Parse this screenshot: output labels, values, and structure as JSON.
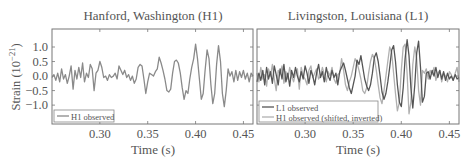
{
  "figure": {
    "ylabel": "Strain (10",
    "ylabel_exp": "−21",
    "ylabel_close": ")",
    "xlabel": "Time (s)"
  },
  "colors": {
    "h1_observed": "#8a8a8a",
    "l1_observed": "#555555",
    "h1_shifted": "#b0b0b0",
    "axis": "#777777",
    "text": "#555555"
  },
  "chart_data": [
    {
      "type": "line",
      "title": "Hanford, Washington (H1)",
      "xlabel": "Time (s)",
      "ylabel": "Strain (10^-21)",
      "xlim": [
        0.25,
        0.46
      ],
      "ylim": [
        -1.65,
        1.62
      ],
      "xticks": [
        0.3,
        0.35,
        0.4,
        0.45
      ],
      "xtick_labels": [
        "0.30",
        "0.35",
        "0.40",
        "0.45"
      ],
      "yticks": [
        1.0,
        0.5,
        0.0,
        -0.5,
        -1.0
      ],
      "ytick_labels": [
        "1.0",
        "0.5",
        "0.0",
        "−0.5",
        "−1.0"
      ],
      "grid": false,
      "legend_position": "lower left",
      "series": [
        {
          "name": "H1 observed",
          "color": "#8a8a8a",
          "t": [
            0.25,
            0.252,
            0.254,
            0.256,
            0.258,
            0.26,
            0.262,
            0.264,
            0.266,
            0.268,
            0.27,
            0.272,
            0.274,
            0.276,
            0.278,
            0.28,
            0.282,
            0.284,
            0.286,
            0.288,
            0.29,
            0.292,
            0.294,
            0.296,
            0.298,
            0.3,
            0.302,
            0.304,
            0.306,
            0.308,
            0.31,
            0.312,
            0.314,
            0.316,
            0.318,
            0.32,
            0.322,
            0.324,
            0.326,
            0.328,
            0.33,
            0.332,
            0.334,
            0.336,
            0.338,
            0.34,
            0.342,
            0.344,
            0.346,
            0.348,
            0.35,
            0.352,
            0.354,
            0.356,
            0.358,
            0.36,
            0.362,
            0.364,
            0.366,
            0.368,
            0.37,
            0.372,
            0.374,
            0.376,
            0.378,
            0.38,
            0.382,
            0.384,
            0.386,
            0.388,
            0.39,
            0.392,
            0.394,
            0.396,
            0.398,
            0.4,
            0.402,
            0.404,
            0.406,
            0.408,
            0.41,
            0.412,
            0.414,
            0.416,
            0.418,
            0.42,
            0.422,
            0.424,
            0.426,
            0.428,
            0.43,
            0.432,
            0.434,
            0.436,
            0.438,
            0.44,
            0.442,
            0.444,
            0.446,
            0.448,
            0.45,
            0.452,
            0.454,
            0.456,
            0.458,
            0.46
          ],
          "v": [
            -0.05,
            0.05,
            -0.15,
            0.1,
            -0.2,
            0.25,
            -0.1,
            0.05,
            -0.25,
            0.0,
            0.35,
            -0.45,
            0.2,
            -0.1,
            0.3,
            -0.05,
            0.45,
            -0.2,
            0.1,
            -0.05,
            0.4,
            0.25,
            -0.5,
            0.1,
            0.2,
            0.5,
            0.3,
            -0.05,
            0.0,
            -0.15,
            0.05,
            -0.05,
            0.0,
            0.1,
            -0.1,
            0.35,
            0.2,
            0.05,
            0.2,
            -0.05,
            0.05,
            -0.15,
            0.0,
            -0.25,
            -0.1,
            0.3,
            0.4,
            0.35,
            -0.1,
            -0.6,
            -0.2,
            0.1,
            0.05,
            0.0,
            0.15,
            0.25,
            0.65,
            0.45,
            0.2,
            -0.1,
            -0.5,
            -0.55,
            -0.45,
            0.1,
            0.5,
            0.55,
            0.45,
            0.1,
            -0.4,
            -0.8,
            -0.5,
            -0.6,
            -0.1,
            0.3,
            0.6,
            1.1,
            0.6,
            -0.1,
            -0.8,
            -0.6,
            0.2,
            0.9,
            0.6,
            -0.3,
            -0.95,
            -0.6,
            0.4,
            1.05,
            0.5,
            -0.6,
            -1.05,
            -0.5,
            0.25,
            0.0,
            0.15,
            -0.2,
            0.2,
            -0.15,
            0.15,
            -0.05,
            0.2,
            -0.1,
            0.1,
            -0.2,
            0.1,
            0.0
          ],
          "legend_label": "H1 observed"
        }
      ]
    },
    {
      "type": "line",
      "title": "Livingston, Louisiana (L1)",
      "xlabel": "Time (s)",
      "xlim": [
        0.25,
        0.46
      ],
      "ylim": [
        -1.65,
        1.62
      ],
      "xticks": [
        0.3,
        0.35,
        0.4,
        0.45
      ],
      "xtick_labels": [
        "0.30",
        "0.35",
        "0.40",
        "0.45"
      ],
      "yticks": [
        1.0,
        0.5,
        0.0,
        -0.5,
        -1.0
      ],
      "grid": false,
      "legend_position": "lower left",
      "series": [
        {
          "name": "L1 observed",
          "color": "#555555",
          "legend_label": "L1 observed",
          "t": [
            0.25,
            0.252,
            0.254,
            0.256,
            0.258,
            0.26,
            0.262,
            0.264,
            0.266,
            0.268,
            0.27,
            0.272,
            0.274,
            0.276,
            0.278,
            0.28,
            0.282,
            0.284,
            0.286,
            0.288,
            0.29,
            0.292,
            0.294,
            0.296,
            0.298,
            0.3,
            0.302,
            0.304,
            0.306,
            0.308,
            0.31,
            0.312,
            0.314,
            0.316,
            0.318,
            0.32,
            0.322,
            0.324,
            0.326,
            0.328,
            0.33,
            0.332,
            0.334,
            0.336,
            0.338,
            0.34,
            0.342,
            0.344,
            0.346,
            0.348,
            0.35,
            0.352,
            0.354,
            0.356,
            0.358,
            0.36,
            0.362,
            0.364,
            0.366,
            0.368,
            0.37,
            0.372,
            0.374,
            0.376,
            0.378,
            0.38,
            0.382,
            0.384,
            0.386,
            0.388,
            0.39,
            0.392,
            0.394,
            0.396,
            0.398,
            0.4,
            0.402,
            0.404,
            0.406,
            0.408,
            0.41,
            0.412,
            0.414,
            0.416,
            0.418,
            0.42,
            0.422,
            0.424,
            0.426,
            0.428,
            0.43,
            0.432,
            0.434,
            0.436,
            0.438,
            0.44,
            0.442,
            0.444,
            0.446,
            0.448,
            0.45,
            0.452,
            0.454,
            0.456,
            0.458,
            0.46
          ],
          "v": [
            -0.2,
            0.1,
            -0.15,
            0.2,
            -0.3,
            0.3,
            -0.1,
            0.15,
            -0.25,
            0.35,
            0.05,
            -0.3,
            0.25,
            -0.1,
            0.4,
            -0.2,
            0.1,
            -0.35,
            0.2,
            -0.05,
            0.3,
            0.0,
            -0.2,
            0.15,
            -0.1,
            0.35,
            0.1,
            -0.25,
            0.2,
            0.0,
            -0.3,
            0.1,
            0.4,
            -0.05,
            0.15,
            -0.2,
            0.3,
            0.0,
            -0.15,
            0.2,
            -0.05,
            0.1,
            -0.3,
            0.15,
            0.3,
            0.45,
            0.2,
            -0.1,
            -0.4,
            -0.6,
            -0.3,
            0.0,
            0.55,
            0.4,
            0.7,
            0.3,
            -0.1,
            -0.35,
            -0.5,
            -0.3,
            0.1,
            0.65,
            0.8,
            0.5,
            0.0,
            -0.55,
            -0.8,
            -0.6,
            -0.2,
            0.3,
            0.9,
            1.05,
            0.5,
            -0.3,
            -0.9,
            -1.05,
            -0.4,
            0.6,
            1.25,
            0.7,
            -0.4,
            -1.1,
            -0.3,
            0.8,
            1.2,
            0.3,
            -0.9,
            -0.7,
            0.1,
            0.15,
            -0.1,
            0.2,
            0.0,
            0.3,
            -0.05,
            0.2,
            -0.1,
            0.15,
            -0.15,
            0.1,
            -0.1,
            0.0,
            -0.15,
            0.05,
            -0.1,
            -0.05
          ],
          "note": "approximate trace"
        },
        {
          "name": "H1 observed (shifted, inverted)",
          "color": "#b0b0b0",
          "legend_label": "H1 observed (shifted, inverted)",
          "t": [
            0.25,
            0.252,
            0.254,
            0.256,
            0.258,
            0.26,
            0.262,
            0.264,
            0.266,
            0.268,
            0.27,
            0.272,
            0.274,
            0.276,
            0.278,
            0.28,
            0.282,
            0.284,
            0.286,
            0.288,
            0.29,
            0.292,
            0.294,
            0.296,
            0.298,
            0.3,
            0.302,
            0.304,
            0.306,
            0.308,
            0.31,
            0.312,
            0.314,
            0.316,
            0.318,
            0.32,
            0.322,
            0.324,
            0.326,
            0.328,
            0.33,
            0.332,
            0.334,
            0.336,
            0.338,
            0.34,
            0.342,
            0.344,
            0.346,
            0.348,
            0.35,
            0.352,
            0.354,
            0.356,
            0.358,
            0.36,
            0.362,
            0.364,
            0.366,
            0.368,
            0.37,
            0.372,
            0.374,
            0.376,
            0.378,
            0.38,
            0.382,
            0.384,
            0.386,
            0.388,
            0.39,
            0.392,
            0.394,
            0.396,
            0.398,
            0.4,
            0.402,
            0.404,
            0.406,
            0.408,
            0.41,
            0.412,
            0.414,
            0.416,
            0.418,
            0.42,
            0.422,
            0.424,
            0.426,
            0.428,
            0.43,
            0.432,
            0.434,
            0.436,
            0.438,
            0.44,
            0.442,
            0.444,
            0.446,
            0.448,
            0.45,
            0.452,
            0.454,
            0.456,
            0.458,
            0.46
          ],
          "v": [
            0.1,
            -0.2,
            0.3,
            -0.1,
            0.05,
            -0.35,
            0.25,
            0.0,
            0.4,
            -0.1,
            -0.5,
            0.2,
            0.05,
            0.35,
            -0.25,
            0.15,
            -0.1,
            0.3,
            0.0,
            -0.2,
            0.1,
            0.25,
            -0.45,
            0.3,
            0.0,
            -0.1,
            -0.3,
            0.2,
            0.35,
            -0.05,
            0.1,
            0.25,
            -0.1,
            0.0,
            0.3,
            0.05,
            -0.2,
            0.15,
            0.0,
            0.3,
            -0.1,
            -0.25,
            0.05,
            0.1,
            0.6,
            0.2,
            -0.3,
            -0.5,
            -0.2,
            0.0,
            0.3,
            0.6,
            0.45,
            0.2,
            -0.1,
            -0.5,
            -0.6,
            -0.4,
            0.1,
            0.5,
            0.75,
            0.6,
            0.2,
            -0.3,
            -0.75,
            -0.95,
            -0.5,
            0.0,
            0.5,
            1.0,
            0.8,
            0.1,
            -0.6,
            -1.2,
            -0.9,
            0.2,
            1.0,
            1.1,
            0.1,
            -1.3,
            -0.9,
            0.4,
            1.0,
            0.6,
            -0.5,
            -1.0,
            0.2,
            0.1,
            0.25,
            -0.1,
            0.2,
            0.05,
            0.3,
            -0.15,
            0.1,
            0.2,
            -0.2,
            0.1,
            0.0,
            -0.2,
            0.15,
            0.05,
            -0.15,
            0.1,
            0.3,
            -0.2
          ],
          "note": "approximate trace"
        }
      ]
    }
  ]
}
